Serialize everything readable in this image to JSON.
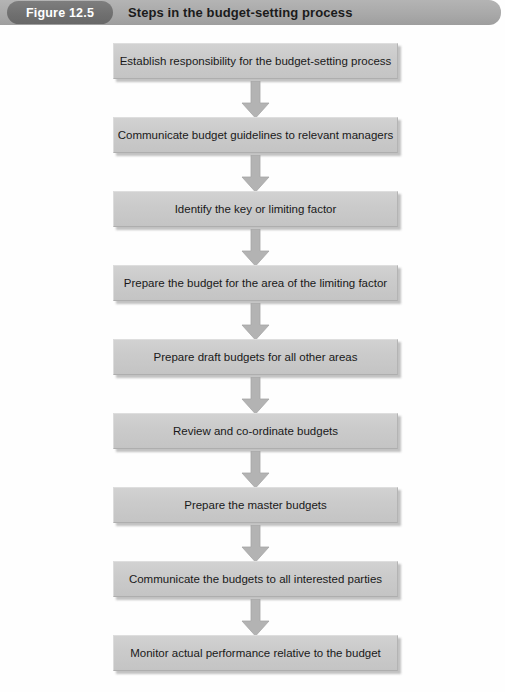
{
  "header": {
    "figure_number": "Figure 12.5",
    "title": "Steps in the budget-setting process"
  },
  "flowchart": {
    "type": "flowchart",
    "orientation": "vertical",
    "connector": "down-arrow",
    "box_fill": "#cbcbcb",
    "header_bar_color": "#a9a9a9",
    "pill_color": "#6f6f6f",
    "arrow_color": "#b0b0b0",
    "steps": [
      {
        "index": 1,
        "label": "Establish responsibility for the budget-setting process"
      },
      {
        "index": 2,
        "label": "Communicate budget guidelines to relevant managers"
      },
      {
        "index": 3,
        "label": "Identify the key or limiting factor"
      },
      {
        "index": 4,
        "label": "Prepare the budget for the area of the limiting factor"
      },
      {
        "index": 5,
        "label": "Prepare draft budgets for all other areas"
      },
      {
        "index": 6,
        "label": "Review and co-ordinate budgets"
      },
      {
        "index": 7,
        "label": "Prepare the master budgets"
      },
      {
        "index": 8,
        "label": "Communicate the budgets to all interested parties"
      },
      {
        "index": 9,
        "label": "Monitor actual performance relative to the budget"
      }
    ]
  }
}
